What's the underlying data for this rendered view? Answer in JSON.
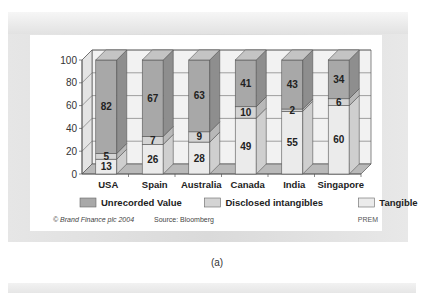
{
  "chart_data": {
    "type": "bar",
    "stacked": true,
    "three_d": true,
    "categories": [
      "USA",
      "Spain",
      "Australia",
      "Canada",
      "India",
      "Singapore"
    ],
    "series": [
      {
        "name": "Tangible",
        "values": [
          13,
          26,
          28,
          49,
          55,
          60
        ],
        "color": "#ebebeb"
      },
      {
        "name": "Disclosed intangibles",
        "values": [
          5,
          7,
          9,
          10,
          2,
          6
        ],
        "color": "#d4d4d4"
      },
      {
        "name": "Unrecorded Value",
        "values": [
          82,
          67,
          63,
          41,
          43,
          34
        ],
        "color": "#a8a8a8"
      }
    ],
    "ylim": [
      0,
      100
    ],
    "yticks": [
      "0",
      "20",
      "40",
      "60",
      "80",
      "100"
    ],
    "grid": true,
    "legend_position": "bottom",
    "legend": [
      "Unrecorded Value",
      "Disclosed intangibles",
      "Tangible"
    ],
    "title": "",
    "xlabel": "",
    "ylabel": ""
  },
  "footer": {
    "copyright": "© Brand Finance plc 2004",
    "source": "Source: Bloomberg",
    "tag": "PREM"
  },
  "caption": "(a)"
}
